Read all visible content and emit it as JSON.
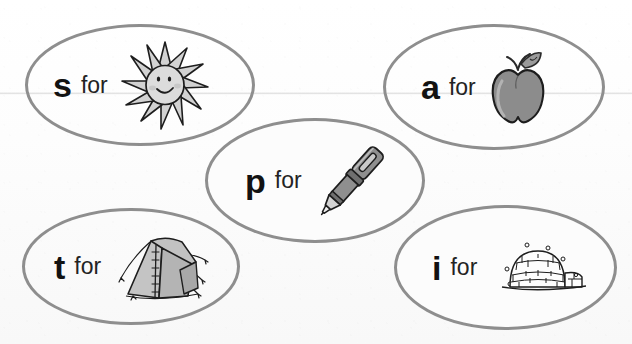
{
  "page": {
    "background_color": "#fbfbfb",
    "oval_stroke_color": "#8e8e8e",
    "ink_color": "#121212",
    "artwork_fill_color": "#cfcfcf",
    "artwork_mid_color": "#8c8c8c"
  },
  "connector_word": "for",
  "cards": [
    {
      "id": "s",
      "letter": "s",
      "for_label": "for",
      "picture_name": "sun-illustration",
      "picture_word": "sun",
      "position": "top-left"
    },
    {
      "id": "a",
      "letter": "a",
      "for_label": "for",
      "picture_name": "apple-illustration",
      "picture_word": "apple",
      "position": "top-right"
    },
    {
      "id": "p",
      "letter": "p",
      "for_label": "for",
      "picture_name": "pen-illustration",
      "picture_word": "pen",
      "position": "center"
    },
    {
      "id": "t",
      "letter": "t",
      "for_label": "for",
      "picture_name": "tent-illustration",
      "picture_word": "tent",
      "position": "bottom-left"
    },
    {
      "id": "i",
      "letter": "i",
      "for_label": "for",
      "picture_name": "igloo-illustration",
      "picture_word": "igloo",
      "position": "bottom-right"
    }
  ]
}
